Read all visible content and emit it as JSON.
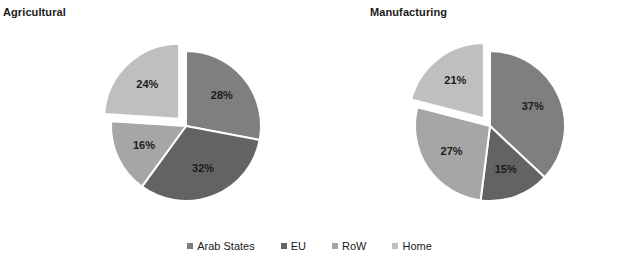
{
  "figure": {
    "background": "#ffffff",
    "width": 619,
    "height": 263
  },
  "palette": {
    "arab_states": "#7f7f7f",
    "eu": "#636363",
    "row": "#a6a6a6",
    "home": "#bfbfbf",
    "slice_border": "#ffffff",
    "label_color": "#1b1b1b",
    "title_color": "#1a1a1a"
  },
  "legend": {
    "position": "bottom-center",
    "items": [
      {
        "label": "Arab States",
        "color": "#7f7f7f"
      },
      {
        "label": "EU",
        "color": "#636363"
      },
      {
        "label": "RoW",
        "color": "#a6a6a6"
      },
      {
        "label": "Home",
        "color": "#bfbfbf"
      }
    ]
  },
  "panels": [
    {
      "title": "Agricultural"
    },
    {
      "title": "Manufacturing"
    }
  ],
  "chart_data": [
    {
      "type": "pie",
      "title": "Agricultural",
      "categories": [
        "Arab States",
        "EU",
        "RoW",
        "Home"
      ],
      "values": [
        28,
        32,
        16,
        24
      ],
      "labels": [
        "28%",
        "32%",
        "16%",
        "24%"
      ],
      "colors": [
        "#7f7f7f",
        "#636363",
        "#a6a6a6",
        "#bfbfbf"
      ],
      "exploded": [
        "Home"
      ],
      "start_angle_deg": 0,
      "direction": "clockwise",
      "units": "percent",
      "legend": "bottom-center",
      "grid": false
    },
    {
      "type": "pie",
      "title": "Manufacturing",
      "categories": [
        "Arab States",
        "EU",
        "RoW",
        "Home"
      ],
      "values": [
        37,
        15,
        27,
        21
      ],
      "labels": [
        "37%",
        "15%",
        "27%",
        "21%"
      ],
      "colors": [
        "#7f7f7f",
        "#636363",
        "#a6a6a6",
        "#bfbfbf"
      ],
      "exploded": [
        "Home"
      ],
      "start_angle_deg": 0,
      "direction": "clockwise",
      "units": "percent",
      "legend": "bottom-center",
      "grid": false
    }
  ]
}
